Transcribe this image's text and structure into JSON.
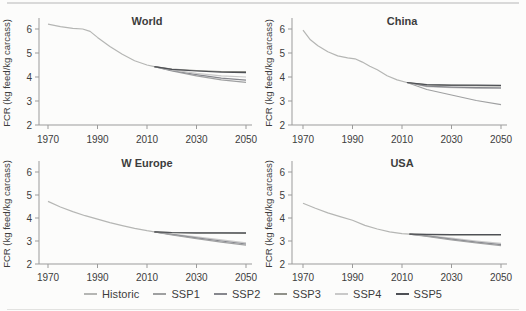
{
  "page": {
    "background": "#fcfcfb"
  },
  "colors": {
    "historic": "#b5b6b4",
    "ssp1": "#9fa0a1",
    "ssp2": "#86878d",
    "ssp3": "#90918a",
    "ssp4": "#c9c9c9",
    "ssp5": "#4e5055",
    "text": "#3d3d3d",
    "axis": "#9b9b9b"
  },
  "legend": {
    "items": [
      {
        "key": "historic",
        "label": "Historic"
      },
      {
        "key": "ssp1",
        "label": "SSP1"
      },
      {
        "key": "ssp2",
        "label": "SSP2"
      },
      {
        "key": "ssp3",
        "label": "SSP3"
      },
      {
        "key": "ssp4",
        "label": "SSP4"
      },
      {
        "key": "ssp5",
        "label": "SSP5"
      }
    ]
  },
  "chart_data": [
    {
      "type": "line",
      "title": "World",
      "ylabel": "FCR (kg feed/kg carcass)",
      "ylim": [
        2,
        6.5
      ],
      "yticks": [
        2,
        3,
        4,
        5,
        6
      ],
      "xlim": [
        1970,
        2050
      ],
      "xticks": [
        1970,
        1990,
        2010,
        2030,
        2050
      ],
      "series": [
        {
          "name": "Historic",
          "key": "historic",
          "points": [
            [
              1970,
              6.2
            ],
            [
              1975,
              6.1
            ],
            [
              1980,
              6.03
            ],
            [
              1984,
              6.0
            ],
            [
              1987,
              5.9
            ],
            [
              1990,
              5.65
            ],
            [
              1995,
              5.27
            ],
            [
              2000,
              4.95
            ],
            [
              2005,
              4.68
            ],
            [
              2010,
              4.5
            ],
            [
              2013,
              4.43
            ]
          ]
        },
        {
          "name": "SSP1",
          "key": "ssp1",
          "points": [
            [
              2013,
              4.43
            ],
            [
              2020,
              4.25
            ],
            [
              2030,
              4.05
            ],
            [
              2040,
              3.88
            ],
            [
              2050,
              3.78
            ]
          ]
        },
        {
          "name": "SSP2",
          "key": "ssp2",
          "points": [
            [
              2013,
              4.43
            ],
            [
              2020,
              4.27
            ],
            [
              2030,
              4.1
            ],
            [
              2040,
              3.95
            ],
            [
              2050,
              3.87
            ]
          ]
        },
        {
          "name": "SSP4",
          "key": "ssp4",
          "points": [
            [
              2013,
              4.43
            ],
            [
              2020,
              4.3
            ],
            [
              2030,
              4.15
            ],
            [
              2040,
              4.05
            ],
            [
              2050,
              4.0
            ]
          ]
        },
        {
          "name": "SSP3",
          "key": "ssp3",
          "points": [
            [
              2013,
              4.43
            ],
            [
              2020,
              4.33
            ],
            [
              2030,
              4.27
            ],
            [
              2040,
              4.23
            ],
            [
              2050,
              4.22
            ]
          ]
        },
        {
          "name": "SSP5",
          "key": "ssp5",
          "points": [
            [
              2013,
              4.43
            ],
            [
              2020,
              4.32
            ],
            [
              2030,
              4.25
            ],
            [
              2040,
              4.2
            ],
            [
              2050,
              4.18
            ]
          ]
        }
      ]
    },
    {
      "type": "line",
      "title": "China",
      "ylabel": "FCR (kg feed/kg carcass)",
      "ylim": [
        2,
        6.5
      ],
      "yticks": [
        2,
        3,
        4,
        5,
        6
      ],
      "xlim": [
        1970,
        2050
      ],
      "xticks": [
        1970,
        1990,
        2010,
        2030,
        2050
      ],
      "series": [
        {
          "name": "Historic",
          "key": "historic",
          "points": [
            [
              1970,
              5.95
            ],
            [
              1973,
              5.55
            ],
            [
              1976,
              5.3
            ],
            [
              1980,
              5.05
            ],
            [
              1984,
              4.88
            ],
            [
              1988,
              4.8
            ],
            [
              1991,
              4.76
            ],
            [
              1994,
              4.62
            ],
            [
              1997,
              4.45
            ],
            [
              2000,
              4.3
            ],
            [
              2004,
              4.05
            ],
            [
              2008,
              3.88
            ],
            [
              2012,
              3.77
            ]
          ]
        },
        {
          "name": "SSP1",
          "key": "ssp1",
          "points": [
            [
              2012,
              3.77
            ],
            [
              2020,
              3.48
            ],
            [
              2030,
              3.25
            ],
            [
              2040,
              3.02
            ],
            [
              2050,
              2.85
            ]
          ]
        },
        {
          "name": "SSP4",
          "key": "ssp4",
          "points": [
            [
              2012,
              3.77
            ],
            [
              2020,
              3.6
            ],
            [
              2030,
              3.56
            ],
            [
              2040,
              3.53
            ],
            [
              2050,
              3.52
            ]
          ]
        },
        {
          "name": "SSP2",
          "key": "ssp2",
          "points": [
            [
              2012,
              3.77
            ],
            [
              2020,
              3.62
            ],
            [
              2030,
              3.58
            ],
            [
              2040,
              3.56
            ],
            [
              2050,
              3.55
            ]
          ]
        },
        {
          "name": "SSP3",
          "key": "ssp3",
          "points": [
            [
              2012,
              3.77
            ],
            [
              2020,
              3.67
            ],
            [
              2030,
              3.65
            ],
            [
              2040,
              3.64
            ],
            [
              2050,
              3.63
            ]
          ]
        },
        {
          "name": "SSP5",
          "key": "ssp5",
          "points": [
            [
              2012,
              3.77
            ],
            [
              2020,
              3.68
            ],
            [
              2030,
              3.66
            ],
            [
              2040,
              3.66
            ],
            [
              2050,
              3.65
            ]
          ]
        }
      ]
    },
    {
      "type": "line",
      "title": "W Europe",
      "ylabel": "FCR (kg feed/kg carcass)",
      "ylim": [
        2,
        6.5
      ],
      "yticks": [
        2,
        3,
        4,
        5,
        6
      ],
      "xlim": [
        1970,
        2050
      ],
      "xticks": [
        1970,
        1990,
        2010,
        2030,
        2050
      ],
      "series": [
        {
          "name": "Historic",
          "key": "historic",
          "points": [
            [
              1970,
              4.72
            ],
            [
              1975,
              4.48
            ],
            [
              1980,
              4.28
            ],
            [
              1985,
              4.1
            ],
            [
              1990,
              3.95
            ],
            [
              1995,
              3.8
            ],
            [
              2000,
              3.67
            ],
            [
              2005,
              3.55
            ],
            [
              2010,
              3.45
            ],
            [
              2013,
              3.4
            ]
          ]
        },
        {
          "name": "SSP4",
          "key": "ssp4",
          "points": [
            [
              2013,
              3.4
            ],
            [
              2020,
              3.3
            ],
            [
              2030,
              3.18
            ],
            [
              2040,
              3.05
            ],
            [
              2050,
              2.92
            ]
          ]
        },
        {
          "name": "SSP2",
          "key": "ssp2",
          "points": [
            [
              2013,
              3.4
            ],
            [
              2020,
              3.29
            ],
            [
              2030,
              3.14
            ],
            [
              2040,
              3.0
            ],
            [
              2050,
              2.87
            ]
          ]
        },
        {
          "name": "SSP1",
          "key": "ssp1",
          "points": [
            [
              2013,
              3.4
            ],
            [
              2020,
              3.27
            ],
            [
              2030,
              3.1
            ],
            [
              2040,
              2.95
            ],
            [
              2050,
              2.82
            ]
          ]
        },
        {
          "name": "SSP3",
          "key": "ssp3",
          "points": [
            [
              2013,
              3.4
            ],
            [
              2020,
              3.36
            ],
            [
              2030,
              3.34
            ],
            [
              2040,
              3.34
            ],
            [
              2050,
              3.33
            ]
          ]
        },
        {
          "name": "SSP5",
          "key": "ssp5",
          "points": [
            [
              2013,
              3.4
            ],
            [
              2020,
              3.37
            ],
            [
              2030,
              3.35
            ],
            [
              2040,
              3.35
            ],
            [
              2050,
              3.35
            ]
          ]
        }
      ]
    },
    {
      "type": "line",
      "title": "USA",
      "ylabel": "FCR (kg feed/kg carcass)",
      "ylim": [
        2,
        6.5
      ],
      "yticks": [
        2,
        3,
        4,
        5,
        6
      ],
      "xlim": [
        1970,
        2050
      ],
      "xticks": [
        1970,
        1990,
        2010,
        2030,
        2050
      ],
      "series": [
        {
          "name": "Historic",
          "key": "historic",
          "points": [
            [
              1970,
              4.64
            ],
            [
              1975,
              4.42
            ],
            [
              1980,
              4.22
            ],
            [
              1985,
              4.06
            ],
            [
              1990,
              3.9
            ],
            [
              1995,
              3.68
            ],
            [
              2000,
              3.52
            ],
            [
              2005,
              3.4
            ],
            [
              2010,
              3.32
            ],
            [
              2013,
              3.3
            ]
          ]
        },
        {
          "name": "SSP4",
          "key": "ssp4",
          "points": [
            [
              2013,
              3.3
            ],
            [
              2020,
              3.23
            ],
            [
              2030,
              3.12
            ],
            [
              2040,
              3.0
            ],
            [
              2050,
              2.9
            ]
          ]
        },
        {
          "name": "SSP2",
          "key": "ssp2",
          "points": [
            [
              2013,
              3.3
            ],
            [
              2020,
              3.22
            ],
            [
              2030,
              3.08
            ],
            [
              2040,
              2.95
            ],
            [
              2050,
              2.84
            ]
          ]
        },
        {
          "name": "SSP1",
          "key": "ssp1",
          "points": [
            [
              2013,
              3.3
            ],
            [
              2020,
              3.2
            ],
            [
              2030,
              3.05
            ],
            [
              2040,
              2.92
            ],
            [
              2050,
              2.8
            ]
          ]
        },
        {
          "name": "SSP3",
          "key": "ssp3",
          "points": [
            [
              2013,
              3.3
            ],
            [
              2020,
              3.28
            ],
            [
              2030,
              3.27
            ],
            [
              2040,
              3.27
            ],
            [
              2050,
              3.26
            ]
          ]
        },
        {
          "name": "SSP5",
          "key": "ssp5",
          "points": [
            [
              2013,
              3.3
            ],
            [
              2020,
              3.29
            ],
            [
              2030,
              3.28
            ],
            [
              2040,
              3.28
            ],
            [
              2050,
              3.28
            ]
          ]
        }
      ]
    }
  ]
}
